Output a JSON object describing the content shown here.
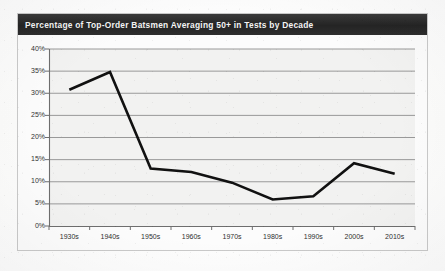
{
  "figure": {
    "title": "Percentage of Top-Order Batsmen Averaging 50+ in Tests by Decade",
    "title_bar_color": "#2b2b2b",
    "title_text_color": "#f4f4f4",
    "plot_background_color": "#f2f2f1",
    "gridline_color": "#8f8f8f",
    "axis_color": "#6e6e6e",
    "series_color": "#111111",
    "frame_border_color": "#c9c9c9",
    "page_background_color": "#fdfdfd"
  },
  "chart_data": {
    "type": "line",
    "title": "Percentage of Top-Order Batsmen Averaging 50+ in Tests by Decade",
    "xlabel": "",
    "ylabel": "",
    "categories": [
      "1930s",
      "1940s",
      "1950s",
      "1960s",
      "1970s",
      "1980s",
      "1990s",
      "2000s",
      "2010s"
    ],
    "values": [
      30.8,
      34.8,
      13.0,
      12.2,
      9.8,
      6.0,
      6.7,
      14.2,
      11.8
    ],
    "series": [
      {
        "name": "Percentage of top-order batsmen averaging 50+",
        "values": [
          30.8,
          34.8,
          13.0,
          12.2,
          9.8,
          6.0,
          6.7,
          14.2,
          11.8
        ]
      }
    ],
    "ylim": [
      0,
      40
    ],
    "ytick_values": [
      0,
      5,
      10,
      15,
      20,
      25,
      30,
      35,
      40
    ],
    "ytick_labels": [
      "0%",
      "5%",
      "10%",
      "15%",
      "20%",
      "25%",
      "30%",
      "35%",
      "40%"
    ],
    "xtick_labels": [
      "1930s",
      "1940s",
      "1950s",
      "1960s",
      "1970s",
      "1980s",
      "1990s",
      "2000s",
      "2010s"
    ],
    "grid": "horizontal",
    "legend": "none",
    "markers": "none",
    "line_width_px": 2.6,
    "annotations": []
  }
}
